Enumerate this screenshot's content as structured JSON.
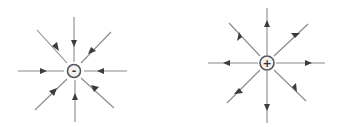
{
  "diagram": {
    "title": "",
    "colors": {
      "line": "#8a8a8a",
      "arrowhead": "#3c3c3c",
      "charge_border": "#555555",
      "charge_fill": "#f2f2f2",
      "background": "#ffffff"
    },
    "charges": [
      {
        "name": "negative-charge",
        "sign": "-",
        "center": [
          74,
          71
        ],
        "radius": 6.5,
        "field_direction": "inward",
        "line_count": 8
      },
      {
        "name": "positive-charge",
        "sign": "+",
        "center": [
          267,
          63
        ],
        "radius": 7,
        "field_direction": "outward",
        "line_count": 8
      }
    ]
  }
}
